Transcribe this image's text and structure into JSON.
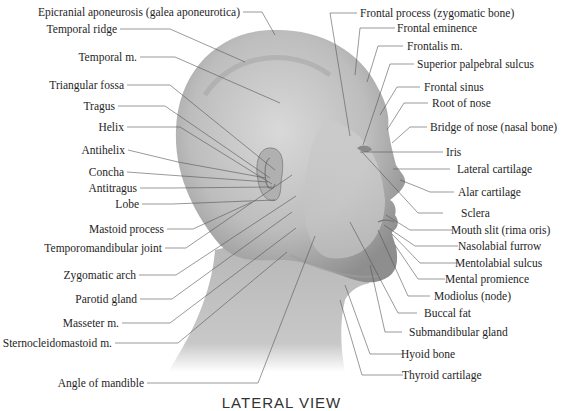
{
  "caption": "LATERAL VIEW",
  "labels_left": [
    {
      "id": "epicranial-aponeurosis",
      "text": "Epicranial aponeurosis (galea aponeurotica)"
    },
    {
      "id": "temporal-ridge",
      "text": "Temporal ridge"
    },
    {
      "id": "temporal-m",
      "text": "Temporal m."
    },
    {
      "id": "triangular-fossa",
      "text": "Triangular fossa"
    },
    {
      "id": "tragus",
      "text": "Tragus"
    },
    {
      "id": "helix",
      "text": "Helix"
    },
    {
      "id": "antihelix",
      "text": "Antihelix"
    },
    {
      "id": "concha",
      "text": "Concha"
    },
    {
      "id": "antitragus",
      "text": "Antitragus"
    },
    {
      "id": "lobe",
      "text": "Lobe"
    },
    {
      "id": "mastoid-process",
      "text": "Mastoid process"
    },
    {
      "id": "temporomandibular-joint",
      "text": "Temporomandibular joint"
    },
    {
      "id": "zygomatic-arch",
      "text": "Zygomatic arch"
    },
    {
      "id": "parotid-gland",
      "text": "Parotid gland"
    },
    {
      "id": "masseter-m",
      "text": "Masseter m."
    },
    {
      "id": "sternocleidomastoid-m",
      "text": "Sternocleidomastoid m."
    },
    {
      "id": "angle-of-mandible",
      "text": "Angle of mandible"
    }
  ],
  "labels_right": [
    {
      "id": "frontal-process",
      "text": "Frontal process (zygomatic bone)"
    },
    {
      "id": "frontal-eminence",
      "text": "Frontal eminence"
    },
    {
      "id": "frontalis-m",
      "text": "Frontalis m."
    },
    {
      "id": "superior-palpebral-sulcus",
      "text": "Superior palpebral sulcus"
    },
    {
      "id": "frontal-sinus",
      "text": "Frontal sinus"
    },
    {
      "id": "root-of-nose",
      "text": "Root of nose"
    },
    {
      "id": "bridge-of-nose",
      "text": "Bridge of nose (nasal bone)"
    },
    {
      "id": "iris",
      "text": "Iris"
    },
    {
      "id": "lateral-cartilage",
      "text": "Lateral cartilage"
    },
    {
      "id": "alar-cartilage",
      "text": "Alar cartilage"
    },
    {
      "id": "sclera",
      "text": "Sclera"
    },
    {
      "id": "mouth-slit",
      "text": "Mouth slit (rima oris)"
    },
    {
      "id": "nasolabial-furrow",
      "text": "Nasolabial furrow"
    },
    {
      "id": "mentolabial-sulcus",
      "text": "Mentolabial sulcus"
    },
    {
      "id": "mental-promience",
      "text": "Mental promience"
    },
    {
      "id": "modiolus",
      "text": "Modiolus (node)"
    },
    {
      "id": "buccal-fat",
      "text": "Buccal fat"
    },
    {
      "id": "submandibular-gland",
      "text": "Submandibular gland"
    },
    {
      "id": "hyoid-bone",
      "text": "Hyoid bone"
    },
    {
      "id": "thyroid-cartilage",
      "text": "Thyroid cartilage"
    }
  ]
}
